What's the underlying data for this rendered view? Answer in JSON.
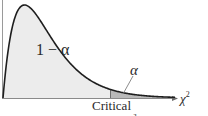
{
  "diagram": {
    "distribution": "chi-square",
    "regions": [
      {
        "name": "acceptance",
        "label": "1 − α",
        "color": "#ececec"
      },
      {
        "name": "rejection-tail",
        "label": "α",
        "color": "#b9b9b9"
      }
    ],
    "x_axis_label": "χ",
    "x_axis_label_sup": "2",
    "critical_label": "Critical",
    "critical_sub_label": "χ²",
    "colors": {
      "curve": "#1e1e1e",
      "axis": "#8a8a8a",
      "critical_line": "#6f6f6f",
      "background": "#ffffff"
    }
  }
}
